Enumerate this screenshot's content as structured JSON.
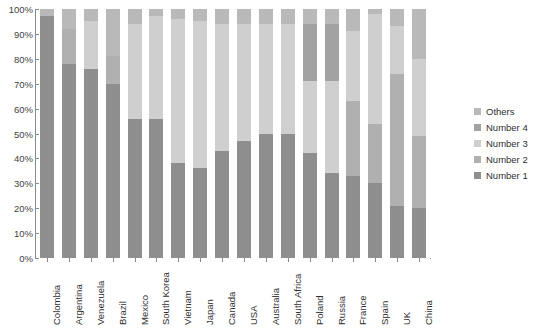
{
  "chart": {
    "title": "",
    "y_axis": {
      "ticks": [
        "100%",
        "90%",
        "80%",
        "70%",
        "60%",
        "50%",
        "40%",
        "30%",
        "20%",
        "10%",
        "0%"
      ]
    }
  },
  "legend": {
    "position": "right",
    "items": [
      {
        "label": "Others",
        "color": "#b9b9b9"
      },
      {
        "label": "Number 4",
        "color": "#a2a2a2"
      },
      {
        "label": "Number 3",
        "color": "#cfcfcf"
      },
      {
        "label": "Number 2",
        "color": "#b0b0b0"
      },
      {
        "label": "Number 1",
        "color": "#8e8e8e"
      }
    ]
  },
  "chart_data": {
    "type": "bar",
    "stacked": true,
    "normalized": true,
    "title": "",
    "xlabel": "",
    "ylabel": "",
    "ylim": [
      0,
      100
    ],
    "ytick_labels": [
      "0%",
      "10%",
      "20%",
      "30%",
      "40%",
      "50%",
      "60%",
      "70%",
      "80%",
      "90%",
      "100%"
    ],
    "grid": true,
    "legend_position": "right",
    "categories": [
      "Colombia",
      "Argentina",
      "Venezuela",
      "Brazil",
      "Mexico",
      "South Korea",
      "Vietnam",
      "Japan",
      "Canada",
      "USA",
      "Australia",
      "South Africa",
      "Poland",
      "Russia",
      "France",
      "Spain",
      "UK",
      "China"
    ],
    "series": [
      {
        "name": "Number 1",
        "color": "#8e8e8e",
        "values": [
          97,
          78,
          76,
          70,
          56,
          56,
          38,
          36,
          43,
          47,
          50,
          50,
          42,
          34,
          33,
          30,
          21,
          20
        ]
      },
      {
        "name": "Number 2",
        "color": "#b0b0b0",
        "values": [
          0,
          14,
          0,
          11,
          0,
          0,
          0,
          0,
          0,
          0,
          0,
          0,
          0,
          0,
          30,
          24,
          53,
          29
        ]
      },
      {
        "name": "Number 3",
        "color": "#cfcfcf",
        "values": [
          0,
          0,
          19,
          0,
          38,
          41,
          58,
          59,
          51,
          47,
          44,
          44,
          29,
          37,
          28,
          44,
          19,
          31
        ]
      },
      {
        "name": "Number 4",
        "color": "#a2a2a2",
        "values": [
          0,
          0,
          0,
          0,
          0,
          0,
          0,
          0,
          0,
          0,
          0,
          0,
          23,
          23,
          0,
          0,
          0,
          0
        ]
      },
      {
        "name": "Others",
        "color": "#b9b9b9",
        "values": [
          3,
          8,
          5,
          19,
          6,
          3,
          4,
          5,
          6,
          6,
          6,
          6,
          6,
          6,
          9,
          2,
          7,
          20
        ]
      }
    ]
  }
}
